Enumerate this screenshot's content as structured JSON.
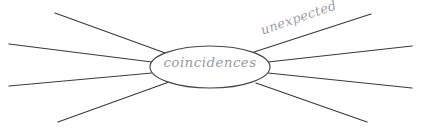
{
  "canvas": {
    "width": 421,
    "height": 134,
    "background": "#ffffff",
    "title": "coincidences spider diagram"
  },
  "hub": {
    "label": "coincidences",
    "text_color": "#9a9a9e",
    "stroke_color": "#45464a",
    "fill_color": "#ffffff",
    "center_x": 210,
    "center_y": 67,
    "radius_x": 60,
    "radius_y": 21
  },
  "branch_labels": [
    {
      "name": "unexpected",
      "text": "unexpected",
      "color": "#a0a0a4",
      "rotation_deg": -19,
      "x": 261,
      "y": 24
    }
  ],
  "rays": {
    "stroke_color": "#3b3b3f",
    "stroke_width": 1.25,
    "count": 8,
    "items": [
      {
        "id": "ray-upper-left",
        "x1": 55,
        "y1": 13,
        "x2": 168,
        "y2": 54
      },
      {
        "id": "ray-middle-upper-left",
        "x1": 9,
        "y1": 44,
        "x2": 152,
        "y2": 62
      },
      {
        "id": "ray-middle-lower-left",
        "x1": 9,
        "y1": 86,
        "x2": 152,
        "y2": 73
      },
      {
        "id": "ray-lower-left",
        "x1": 58,
        "y1": 122,
        "x2": 169,
        "y2": 82
      },
      {
        "id": "ray-upper-right",
        "x1": 254,
        "y1": 52,
        "x2": 371,
        "y2": 14
      },
      {
        "id": "ray-middle-upper-right",
        "x1": 268,
        "y1": 62,
        "x2": 412,
        "y2": 46
      },
      {
        "id": "ray-middle-lower-right",
        "x1": 268,
        "y1": 73,
        "x2": 412,
        "y2": 88
      },
      {
        "id": "ray-lower-right",
        "x1": 256,
        "y1": 83,
        "x2": 367,
        "y2": 122
      }
    ]
  }
}
